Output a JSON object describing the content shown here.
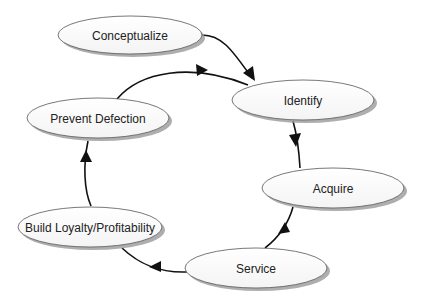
{
  "diagram": {
    "type": "cycle-flowchart",
    "nodes": [
      {
        "id": "conceptualize",
        "label": "Conceptualize"
      },
      {
        "id": "identify",
        "label": "Identify"
      },
      {
        "id": "acquire",
        "label": "Acquire"
      },
      {
        "id": "service",
        "label": "Service"
      },
      {
        "id": "build-loyalty",
        "label": "Build Loyalty/Profitability"
      },
      {
        "id": "prevent-defection",
        "label": "Prevent Defection"
      }
    ],
    "edges": [
      {
        "from": "conceptualize",
        "to": "identify"
      },
      {
        "from": "identify",
        "to": "acquire"
      },
      {
        "from": "acquire",
        "to": "service"
      },
      {
        "from": "service",
        "to": "build-loyalty"
      },
      {
        "from": "build-loyalty",
        "to": "prevent-defection"
      },
      {
        "from": "prevent-defection",
        "to": "identify"
      }
    ],
    "colors": {
      "node_fill": "#ffffff",
      "node_stroke": "#555555",
      "shadow": "#9a9a9a",
      "edge": "#111111"
    }
  }
}
